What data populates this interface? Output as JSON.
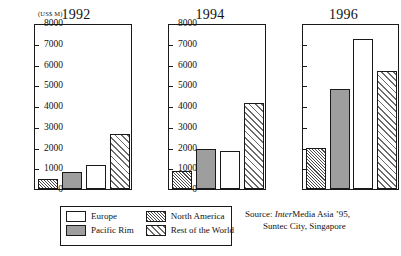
{
  "unit_label": "(US$ M)",
  "legend": {
    "items": [
      {
        "label": "Europe",
        "pattern": "solid-white",
        "color": "#ffffff"
      },
      {
        "label": "North America",
        "pattern": "fine-hatch",
        "color": "#4a4a4a"
      },
      {
        "label": "Pacific Rim",
        "pattern": "solid-gray",
        "color": "#9e9e9e"
      },
      {
        "label": "Rest of the World",
        "pattern": "coarse-hatch",
        "color": "#6b6b6b"
      }
    ]
  },
  "source": {
    "prefix": "Source: ",
    "italic_part": "Inter",
    "rest_line1": "Media Asia ’95,",
    "line2": "Suntec City, Singapore"
  },
  "axis": {
    "ticks": [
      "8000",
      "7000",
      "6000",
      "5000",
      "4000",
      "3000",
      "2000",
      "1000",
      "0"
    ]
  },
  "chart_data": {
    "type": "bar",
    "title": "",
    "xlabel": "",
    "ylabel": "(US$ M)",
    "ylim": [
      0,
      8000
    ],
    "ytick_step": 1000,
    "grid": false,
    "legend_position": "bottom-left",
    "panels": [
      "1992",
      "1994",
      "1996"
    ],
    "categories": [
      "North America",
      "Pacific Rim",
      "Europe",
      "Rest of the World"
    ],
    "series": [
      {
        "name": "1992",
        "values": [
          500,
          800,
          1150,
          2650
        ]
      },
      {
        "name": "1994",
        "values": [
          850,
          1950,
          1850,
          4150
        ]
      },
      {
        "name": "1996",
        "values": [
          2000,
          4800,
          7250,
          5700
        ]
      }
    ]
  }
}
